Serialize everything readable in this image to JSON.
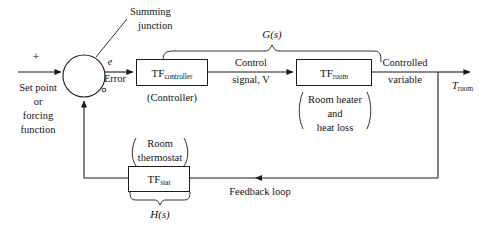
{
  "diagram": {
    "input": {
      "plus_sign": "+",
      "label_line1": "Set point",
      "label_line2": "or",
      "label_line3": "forcing",
      "label_line4": "function"
    },
    "summing_junction": {
      "annotation_line1": "Summing",
      "annotation_line2": "junction",
      "minus_marker": "○"
    },
    "error_signal": {
      "symbol": "e",
      "label": "Error"
    },
    "controller_block": {
      "main": "TF",
      "subscript": "controller",
      "caption": "(Controller)"
    },
    "control_signal": {
      "line1": "Control",
      "line2": "signal, V"
    },
    "room_block": {
      "main": "TF",
      "subscript": "room",
      "caption_line1": "Room heater",
      "caption_line2": "and",
      "caption_line3": "heat loss"
    },
    "controlled_variable": {
      "line1": "Controlled",
      "line2": "variable"
    },
    "output": {
      "main": "T",
      "subscript": "room"
    },
    "forward_path": {
      "label_main": "G",
      "label_arg": "(s)",
      "label_full": "G(s)"
    },
    "feedback_path": {
      "label_main": "H",
      "label_arg": "(s)",
      "label_full": "H(s)"
    },
    "thermostat_block": {
      "main": "TF",
      "subscript": "stat",
      "caption_line1": "Room",
      "caption_line2": "thermostat"
    },
    "feedback_loop_label": "Feedback loop",
    "colors": {
      "line": "#1a1a1a",
      "text": "#141414",
      "background": "#ffffff"
    }
  }
}
